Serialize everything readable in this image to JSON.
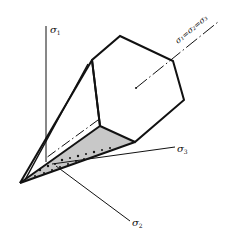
{
  "diagram": {
    "title": "",
    "colors": {
      "stroke": "#111111",
      "background": "#ffffff"
    },
    "labels": {
      "sigma1": {
        "base": "σ",
        "sub": "1"
      },
      "sigma2": {
        "base": "σ",
        "sub": "2"
      },
      "sigma3": {
        "base": "σ",
        "sub": "3"
      },
      "hydrostatic_axis": "σ₁=σ₂=σ₃"
    },
    "elements": {
      "hexagonal_yield_surface": "Tresca hexagonal prism cross-section",
      "cone": "Pyramid from origin to hexagon",
      "axes": [
        "σ1",
        "σ2",
        "σ3"
      ],
      "hydrostatic_line": "dash-dot line along σ1=σ2=σ3"
    }
  }
}
